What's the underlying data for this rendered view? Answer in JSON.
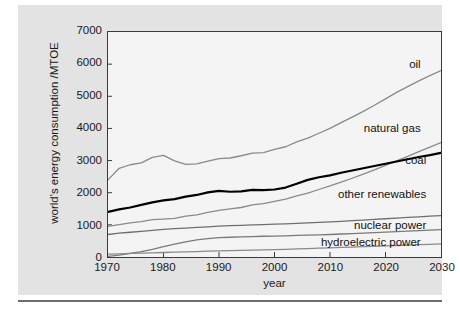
{
  "figure": {
    "background_color": "#e3e3e3",
    "plot_background_color": "#f4f4f4",
    "axis_color": "#3a3a3a"
  },
  "chart_data": {
    "type": "line",
    "title": "",
    "xlabel": "year",
    "ylabel": "world's energy consumption /MTOE",
    "xlim": [
      1970,
      2030
    ],
    "ylim": [
      0,
      7000
    ],
    "xticks": [
      1970,
      1980,
      1990,
      2000,
      2010,
      2020,
      2030
    ],
    "yticks": [
      0,
      1000,
      2000,
      3000,
      4000,
      5000,
      6000,
      7000
    ],
    "grid": false,
    "legend_position": "inline-right-annotations",
    "x": [
      1970,
      1972,
      1974,
      1976,
      1978,
      1980,
      1982,
      1984,
      1986,
      1988,
      1990,
      1992,
      1994,
      1996,
      1998,
      2000,
      2002,
      2004,
      2006,
      2008,
      2010,
      2012,
      2014,
      2016,
      2018,
      2020,
      2022,
      2024,
      2026,
      2028,
      2030
    ],
    "series": [
      {
        "name": "oil",
        "color": "#8a8a8a",
        "width": 1.3,
        "values": [
          2400,
          2760,
          2870,
          2930,
          3100,
          3160,
          2990,
          2880,
          2900,
          2980,
          3060,
          3080,
          3150,
          3230,
          3250,
          3350,
          3430,
          3580,
          3700,
          3850,
          4000,
          4180,
          4350,
          4530,
          4720,
          4920,
          5120,
          5300,
          5480,
          5640,
          5800
        ]
      },
      {
        "name": "natural gas",
        "color": "#8a8a8a",
        "width": 1.3,
        "values": [
          950,
          1010,
          1060,
          1100,
          1160,
          1180,
          1200,
          1270,
          1310,
          1390,
          1450,
          1500,
          1540,
          1620,
          1660,
          1730,
          1800,
          1900,
          1990,
          2100,
          2210,
          2330,
          2450,
          2580,
          2710,
          2850,
          2990,
          3130,
          3280,
          3420,
          3560
        ]
      },
      {
        "name": "coal",
        "color": "#000000",
        "width": 2.2,
        "values": [
          1400,
          1480,
          1540,
          1620,
          1700,
          1760,
          1800,
          1880,
          1930,
          2010,
          2060,
          2030,
          2040,
          2090,
          2080,
          2100,
          2160,
          2280,
          2400,
          2480,
          2540,
          2620,
          2690,
          2760,
          2830,
          2900,
          2970,
          3040,
          3110,
          3170,
          3240
        ]
      },
      {
        "name": "other renewables",
        "color": "#6f6f6f",
        "width": 1.3,
        "values": [
          700,
          740,
          770,
          800,
          830,
          860,
          880,
          900,
          920,
          940,
          960,
          975,
          985,
          1000,
          1010,
          1020,
          1030,
          1045,
          1060,
          1075,
          1090,
          1110,
          1130,
          1150,
          1170,
          1190,
          1210,
          1230,
          1250,
          1270,
          1290
        ]
      },
      {
        "name": "nuclear power",
        "color": "#7a7a7a",
        "width": 1.3,
        "values": [
          20,
          60,
          110,
          170,
          240,
          320,
          400,
          470,
          530,
          570,
          600,
          615,
          625,
          635,
          645,
          650,
          660,
          670,
          680,
          690,
          700,
          715,
          730,
          745,
          760,
          775,
          790,
          805,
          820,
          835,
          850
        ]
      },
      {
        "name": "hydroelectric power",
        "color": "#8a8a8a",
        "width": 1.3,
        "values": [
          90,
          100,
          110,
          120,
          130,
          140,
          150,
          160,
          170,
          180,
          190,
          198,
          206,
          214,
          222,
          230,
          240,
          250,
          262,
          274,
          286,
          298,
          310,
          322,
          334,
          346,
          358,
          370,
          382,
          394,
          406
        ]
      }
    ],
    "annotations": [
      {
        "text": "oil",
        "x": 2026,
        "y": 5980
      },
      {
        "text": "natural gas",
        "x": 2026,
        "y": 4000
      },
      {
        "text": "coal",
        "x": 2027,
        "y": 3030
      },
      {
        "text": "other renewables",
        "x": 2027,
        "y": 1980
      },
      {
        "text": "nuclear power",
        "x": 2027,
        "y": 1020
      },
      {
        "text": "hydroelectric power",
        "x": 2026,
        "y": 480
      }
    ]
  }
}
